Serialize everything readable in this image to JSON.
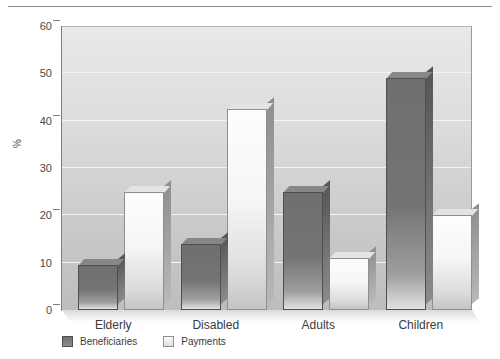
{
  "chart_data": {
    "type": "bar",
    "title": "",
    "xlabel": "",
    "ylabel": "%",
    "ylim": [
      0,
      60
    ],
    "ytick_step": 10,
    "yticks": [
      "0",
      "10",
      "20",
      "30",
      "40",
      "50",
      "60"
    ],
    "grid": true,
    "legend_position": "bottom-left",
    "categories": [
      "Elderly",
      "Disabled",
      "Adults",
      "Children"
    ],
    "series": [
      {
        "name": "Beneficiaries",
        "color": "#7a7a7a",
        "values": [
          9.5,
          14,
          25,
          49
        ]
      },
      {
        "name": "Payments",
        "color": "#f2f2f2",
        "values": [
          25,
          42.5,
          11,
          20
        ]
      }
    ]
  },
  "colors": {
    "plot_background": "#d6d6d6",
    "gridline": "#f4f4f4",
    "axis": "#7d7d7d",
    "text": "#3a3a3a",
    "rule": "#8a8a8a"
  }
}
